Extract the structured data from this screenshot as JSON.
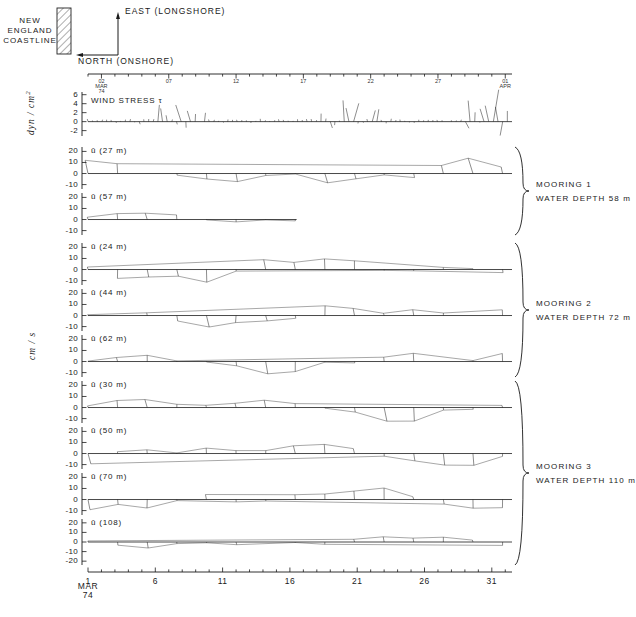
{
  "figure": {
    "coastline_label": "NEW\nENGLAND\nCOASTLINE",
    "axis_east_label": "EAST (LONGSHORE)",
    "axis_north_label": "NORTH (ONSHORE)",
    "stress_units_label": "dyn / cm",
    "stress_units_exp": "2",
    "velocity_units_label": "cm / s",
    "wind_stress_title": "WIND STRESS",
    "wind_stress_symbol": "τ",
    "ink_color": "#1a1a1a"
  },
  "top_axis": {
    "labels": [
      "02\nMAR\n74",
      "07",
      "12",
      "17",
      "22",
      "27",
      "01\nAPR"
    ],
    "label_days": [
      2,
      7,
      12,
      17,
      22,
      27,
      32
    ],
    "tick_interval_days": 1,
    "domain_days": [
      1,
      32.5
    ]
  },
  "bottom_axis": {
    "labels": [
      "1",
      "6",
      "11",
      "16",
      "21",
      "26",
      "31"
    ],
    "label_days": [
      1,
      6,
      11,
      16,
      21,
      26,
      31
    ],
    "start_caption": "MAR\n74",
    "tick_interval_days": 1,
    "domain_days": [
      1,
      32.5
    ]
  },
  "moorings": [
    {
      "name": "MOORING 1",
      "depth_label": "WATER DEPTH 58 m"
    },
    {
      "name": "MOORING 2",
      "depth_label": "WATER DEPTH 72 m"
    },
    {
      "name": "MOORING 3",
      "depth_label": "WATER DEPTH 110 m"
    }
  ],
  "panels": [
    {
      "id": "wind-stress",
      "title_prefix": "WIND STRESS",
      "title_symbol": "τ",
      "label": "WIND STRESS τ",
      "series_name": "wind stress",
      "units": "dyn/cm2",
      "yticks": [
        6,
        4,
        2,
        0,
        -2
      ],
      "ylim": [
        -3.2,
        6.6
      ],
      "top": 92,
      "height": 44,
      "mooring": null,
      "seed": 11,
      "density": 2.6,
      "scale": 1.0,
      "kind": "stress"
    },
    {
      "id": "u-27m",
      "label": "ū (27 m)",
      "depth_m": 27,
      "series_name": "velocity 27 m",
      "units": "cm/s",
      "yticks": [
        20,
        10,
        0,
        -10
      ],
      "ylim": [
        -14,
        24
      ],
      "top": 147,
      "height": 42,
      "mooring": 1,
      "seed": 21,
      "density": 1.0,
      "scale": 1.0,
      "kind": "vel"
    },
    {
      "id": "u-57m",
      "label": "ū (57 m)",
      "depth_m": 57,
      "series_name": "velocity 57 m",
      "units": "cm/s",
      "yticks": [
        20,
        10,
        0,
        -10
      ],
      "ylim": [
        -14,
        24
      ],
      "top": 193,
      "height": 42,
      "mooring": 1,
      "seed": 22,
      "density": 1.0,
      "scale": 0.55,
      "truncate_at_day": 16.5,
      "kind": "vel"
    },
    {
      "id": "u-24m",
      "label": "ū (24 m)",
      "depth_m": 24,
      "series_name": "velocity 24 m",
      "units": "cm/s",
      "yticks": [
        20,
        10,
        0,
        -10
      ],
      "ylim": [
        -14,
        24
      ],
      "top": 243,
      "height": 42,
      "mooring": 2,
      "seed": 31,
      "density": 1.0,
      "scale": 1.0,
      "kind": "vel"
    },
    {
      "id": "u-44m",
      "label": "ū (44 m)",
      "depth_m": 44,
      "series_name": "velocity 44 m",
      "units": "cm/s",
      "yticks": [
        20,
        10,
        0,
        -10
      ],
      "ylim": [
        -14,
        24
      ],
      "top": 289,
      "height": 42,
      "mooring": 2,
      "seed": 32,
      "density": 1.0,
      "scale": 0.85,
      "kind": "vel"
    },
    {
      "id": "u-62m",
      "label": "ū (62 m)",
      "depth_m": 62,
      "series_name": "velocity 62 m",
      "units": "cm/s",
      "yticks": [
        20,
        10,
        0,
        -10
      ],
      "ylim": [
        -14,
        24
      ],
      "top": 335,
      "height": 42,
      "mooring": 2,
      "seed": 33,
      "density": 1.0,
      "scale": 0.8,
      "kind": "vel"
    },
    {
      "id": "u-30m",
      "label": "ū (30 m)",
      "depth_m": 30,
      "series_name": "velocity 30 m",
      "units": "cm/s",
      "yticks": [
        20,
        10,
        0,
        -10
      ],
      "ylim": [
        -14,
        24
      ],
      "top": 381,
      "height": 42,
      "mooring": 3,
      "seed": 41,
      "density": 1.0,
      "scale": 1.0,
      "kind": "vel"
    },
    {
      "id": "u-50m",
      "label": "ū (50 m)",
      "depth_m": 50,
      "series_name": "velocity 50 m",
      "units": "cm/s",
      "yticks": [
        20,
        10,
        0,
        -10
      ],
      "ylim": [
        -14,
        24
      ],
      "top": 427,
      "height": 42,
      "mooring": 3,
      "seed": 42,
      "density": 1.0,
      "scale": 0.95,
      "kind": "vel"
    },
    {
      "id": "u-70m",
      "label": "ū (70 m)",
      "depth_m": 70,
      "series_name": "velocity 70 m",
      "units": "cm/s",
      "yticks": [
        20,
        10,
        0,
        -10
      ],
      "ylim": [
        -14,
        24
      ],
      "top": 473,
      "height": 42,
      "mooring": 3,
      "seed": 43,
      "density": 1.0,
      "scale": 0.9,
      "kind": "vel"
    },
    {
      "id": "u-108",
      "label": "ū (108)",
      "depth_m": 108,
      "series_name": "velocity 108 m",
      "units": "cm/s",
      "yticks": [
        20,
        10,
        0,
        -10,
        -20
      ],
      "ylim": [
        -24,
        24
      ],
      "top": 519,
      "height": 46,
      "mooring": 3,
      "seed": 44,
      "density": 1.0,
      "scale": 0.5,
      "kind": "vel"
    }
  ],
  "chart_data": {
    "type": "line",
    "xlabel": "MAR 74",
    "ylabel_stress": "dyn/cm2",
    "ylabel_velocity": "cm/s",
    "x_ticks": [
      1,
      6,
      11,
      16,
      21,
      26,
      31
    ],
    "x_tick_labels": [
      "1",
      "6",
      "11",
      "16",
      "21",
      "26",
      "31"
    ],
    "x_ticks_top": [
      2,
      7,
      12,
      17,
      22,
      27,
      32
    ],
    "x_tick_labels_top": [
      "02 MAR 74",
      "07",
      "12",
      "17",
      "22",
      "27",
      "01 APR"
    ],
    "xlim": [
      1,
      32.5
    ],
    "grid": false,
    "legend": "none",
    "series": [
      {
        "name": "wind stress",
        "units": "dyn/cm2",
        "ylim": [
          -3.2,
          6.6
        ],
        "yticks": [
          6,
          4,
          2,
          0,
          -2
        ]
      },
      {
        "name": "velocity 27 m",
        "mooring": "MOORING 1",
        "units": "cm/s",
        "ylim": [
          -14,
          24
        ],
        "yticks": [
          20,
          10,
          0,
          -10
        ]
      },
      {
        "name": "velocity 57 m",
        "mooring": "MOORING 1",
        "units": "cm/s",
        "ylim": [
          -14,
          24
        ],
        "yticks": [
          20,
          10,
          0,
          -10
        ]
      },
      {
        "name": "velocity 24 m",
        "mooring": "MOORING 2",
        "units": "cm/s",
        "ylim": [
          -14,
          24
        ],
        "yticks": [
          20,
          10,
          0,
          -10
        ]
      },
      {
        "name": "velocity 44 m",
        "mooring": "MOORING 2",
        "units": "cm/s",
        "ylim": [
          -14,
          24
        ],
        "yticks": [
          20,
          10,
          0,
          -10
        ]
      },
      {
        "name": "velocity 62 m",
        "mooring": "MOORING 2",
        "units": "cm/s",
        "ylim": [
          -14,
          24
        ],
        "yticks": [
          20,
          10,
          0,
          -10
        ]
      },
      {
        "name": "velocity 30 m",
        "mooring": "MOORING 3",
        "units": "cm/s",
        "ylim": [
          -14,
          24
        ],
        "yticks": [
          20,
          10,
          0,
          -10
        ]
      },
      {
        "name": "velocity 50 m",
        "mooring": "MOORING 3",
        "units": "cm/s",
        "ylim": [
          -14,
          24
        ],
        "yticks": [
          20,
          10,
          0,
          -10
        ]
      },
      {
        "name": "velocity 70 m",
        "mooring": "MOORING 3",
        "units": "cm/s",
        "ylim": [
          -14,
          24
        ],
        "yticks": [
          20,
          10,
          0,
          -10
        ]
      },
      {
        "name": "velocity 108 m",
        "mooring": "MOORING 3",
        "units": "cm/s",
        "ylim": [
          -24,
          24
        ],
        "yticks": [
          20,
          10,
          0,
          -10,
          -20
        ]
      }
    ]
  }
}
